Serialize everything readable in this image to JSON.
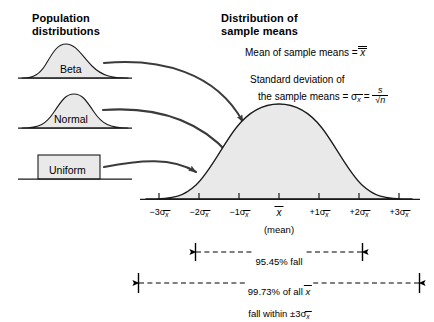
{
  "headings": {
    "population": "Population\ndistributions",
    "sampling": "Distribution of\nsample means"
  },
  "populations": [
    {
      "label": "Beta",
      "shape": "skewed-curve"
    },
    {
      "label": "Normal",
      "shape": "bell-curve"
    },
    {
      "label": "Uniform",
      "shape": "rectangle"
    }
  ],
  "formulas": {
    "mean_label": "Mean of sample means = ",
    "mean_symbol": "x",
    "sd_line1": "Standard deviation of",
    "sd_line2": "the sample means = ",
    "sd_symbol": "σ",
    "sd_subscript": "x",
    "sd_equals": " = ",
    "fraction_numerator": "s",
    "fraction_denominator": "√n"
  },
  "axis": {
    "ticks": [
      {
        "sign": "−3",
        "sigma": "σ",
        "sub": "x"
      },
      {
        "sign": "−2",
        "sigma": "σ",
        "sub": "x"
      },
      {
        "sign": "−1",
        "sigma": "σ",
        "sub": "x"
      },
      {
        "sign": "",
        "sigma": "",
        "sub": "",
        "center": "x"
      },
      {
        "sign": "+1",
        "sigma": "σ",
        "sub": "x"
      },
      {
        "sign": "+2",
        "sigma": "σ",
        "sub": "x"
      },
      {
        "sign": "+3",
        "sigma": "σ",
        "sub": "x"
      }
    ],
    "mean_note": "(mean)"
  },
  "bands": [
    {
      "percent": "95.45%",
      "line1_a": "95.45% fall",
      "line2_a": "within ±2",
      "sigma": "σ",
      "sub": "x",
      "span": "±2 sigma"
    },
    {
      "percent": "99.73%",
      "line1_a": "99.73% of all ",
      "line1_sym": "x",
      "line2_a": "fall within ±3",
      "sigma": "σ",
      "sub": "x",
      "span": "±3 sigma"
    }
  ],
  "colors": {
    "curve_fill": "#e9e9e9",
    "curve_stroke": "#1a1a1a",
    "arrow": "#3b3b3b",
    "axis": "#1a1a1a",
    "background": "#ffffff"
  }
}
